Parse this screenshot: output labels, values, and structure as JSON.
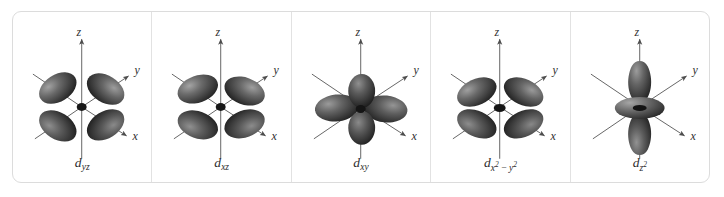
{
  "figure": {
    "panel_count": 5,
    "background_color": "#ffffff",
    "border_color": "#dcdcdc",
    "divider_color": "#e2e2e2",
    "lobe_color": "#4a4a4a",
    "lobe_dark_color": "#2a2a2a",
    "lobe_highlight_color": "#9a9a9a",
    "axis_color": "#555555",
    "label_color": "#2b2b2b"
  },
  "axes": {
    "z": "z",
    "y": "y",
    "x": "x"
  },
  "panels": [
    {
      "id": "d-yz",
      "label_base": "d",
      "label_sub_html": "yz",
      "label_plain": "dyz",
      "lobe_layout": "four-lobes-diagonal-yz",
      "lobe_count": 4
    },
    {
      "id": "d-xz",
      "label_base": "d",
      "label_sub_html": "xz",
      "label_plain": "dxz",
      "lobe_layout": "four-lobes-diagonal-xz",
      "lobe_count": 4
    },
    {
      "id": "d-xy",
      "label_base": "d",
      "label_sub_html": "xy",
      "label_plain": "dxy",
      "lobe_layout": "four-lobes-cross-xy",
      "lobe_count": 4
    },
    {
      "id": "d-x2-y2",
      "label_base": "d",
      "label_sub_html": "x<sup>2</sup> − y<sup>2</sup>",
      "label_plain": "dx2−y2",
      "lobe_layout": "four-lobes-along-axes",
      "lobe_count": 4
    },
    {
      "id": "d-z2",
      "label_base": "d",
      "label_sub_html": "z<sup>2</sup>",
      "label_plain": "dz2",
      "lobe_layout": "two-lobes-plus-torus",
      "lobe_count": 2,
      "has_torus": true
    }
  ]
}
